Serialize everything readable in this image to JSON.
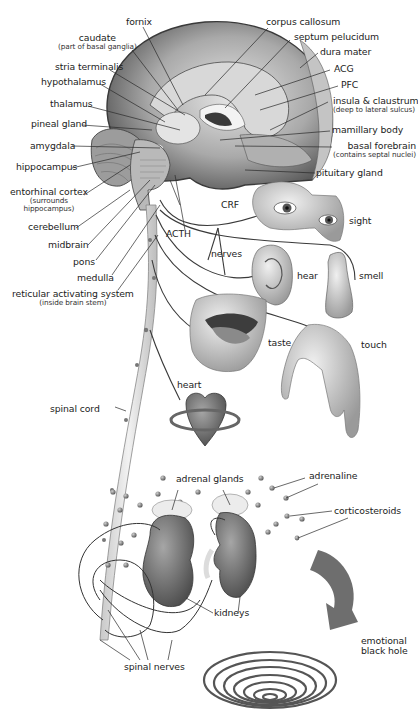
{
  "diagram": {
    "title_cropped": true,
    "palette": {
      "background": "#ffffff",
      "label_text": "#1c1c1c",
      "leader_lines": "#2a2a2a",
      "brain_light": "#d9d9d9",
      "brain_mid": "#9b9b9b",
      "brain_dark": "#4a4a4a",
      "organ_gray": "#7a7a7a"
    },
    "brain_labels_left": [
      {
        "id": "fornix",
        "text": "fornix"
      },
      {
        "id": "caudate",
        "text": "caudate",
        "sub": "(part of basal ganglia)"
      },
      {
        "id": "stria-terminalis",
        "text": "stria terminalis"
      },
      {
        "id": "hypothalamus",
        "text": "hypothalamus"
      },
      {
        "id": "thalamus",
        "text": "thalamus"
      },
      {
        "id": "pineal-gland",
        "text": "pineal gland"
      },
      {
        "id": "amygdala",
        "text": "amygdala"
      },
      {
        "id": "hippocampus",
        "text": "hippocampus"
      },
      {
        "id": "entorhinal-cortex",
        "text": "entorhinal cortex",
        "sub1": "(surrounds",
        "sub2": "hippocampus)"
      },
      {
        "id": "cerebellum",
        "text": "cerebellum"
      },
      {
        "id": "midbrain",
        "text": "midbrain"
      },
      {
        "id": "pons",
        "text": "pons"
      },
      {
        "id": "medulla",
        "text": "medulla"
      },
      {
        "id": "reticular-activating-system",
        "text": "reticular activating system",
        "sub": "(inside brain stem)"
      }
    ],
    "brain_labels_right": [
      {
        "id": "corpus-callosum",
        "text": "corpus callosum"
      },
      {
        "id": "septum-pelucidum",
        "text": "septum pelucidum"
      },
      {
        "id": "dura-mater",
        "text": "dura mater"
      },
      {
        "id": "acg",
        "text": "ACG"
      },
      {
        "id": "pfc",
        "text": "PFC"
      },
      {
        "id": "insula-claustrum",
        "text": "insula & claustrum",
        "sub": "(deep to lateral sulcus)"
      },
      {
        "id": "mamillary-body",
        "text": "mamillary body"
      },
      {
        "id": "basal-forebrain",
        "text": "basal forebrain",
        "sub": "(contains septal nuclei)"
      },
      {
        "id": "pituitary-gland",
        "text": "pituitary gland"
      }
    ],
    "pathway_labels": {
      "crf": "CRF",
      "acth": "ACTH",
      "nerves": "nerves",
      "spinal_cord": "spinal cord",
      "spinal_nerves": "spinal nerves"
    },
    "senses": {
      "sight": "sight",
      "hear": "hear",
      "smell": "smell",
      "taste": "taste",
      "touch": "touch"
    },
    "body": {
      "heart": "heart",
      "adrenal_glands": "adrenal glands",
      "kidneys": "kidneys",
      "adrenaline": "adrenaline",
      "corticosteroids": "corticosteroids",
      "emotional_black_hole_line1": "emotional",
      "emotional_black_hole_line2": "black hole"
    }
  }
}
